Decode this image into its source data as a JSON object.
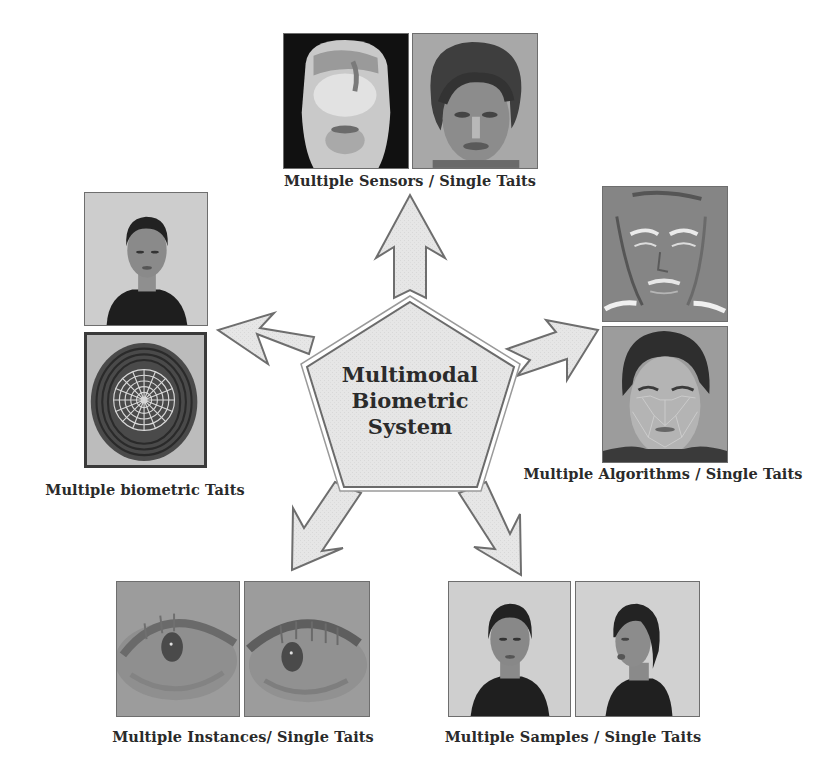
{
  "center": {
    "lines": [
      "Multimodal",
      "Biometric",
      "System"
    ],
    "shape": "pentagon",
    "fill": "#e6e6e6",
    "stroke": "#6b6b6b"
  },
  "branches": [
    {
      "id": "top",
      "caption": "Multiple Sensors / Single Taits",
      "images": [
        "thermal-infrared-face",
        "visible-light-face"
      ]
    },
    {
      "id": "left",
      "caption": "Multiple biometric Taits",
      "images": [
        "frontal-face-photo",
        "fingerprint-with-polar-grid"
      ]
    },
    {
      "id": "right",
      "caption": "Multiple Algorithms / Single Taits",
      "images": [
        "edge-filtered-face",
        "face-with-landmark-mesh"
      ]
    },
    {
      "id": "bottom-left",
      "caption": "Multiple Instances/ Single Taits",
      "images": [
        "left-eye-iris",
        "right-eye-iris"
      ]
    },
    {
      "id": "bottom-right",
      "caption": "Multiple Samples / Single Taits",
      "images": [
        "face-sample-frontal",
        "face-sample-turned"
      ]
    }
  ],
  "colors": {
    "arrow_fill": "#e4e4e4",
    "arrow_stroke": "#707070",
    "text": "#2a2a2a",
    "background": "#ffffff"
  }
}
